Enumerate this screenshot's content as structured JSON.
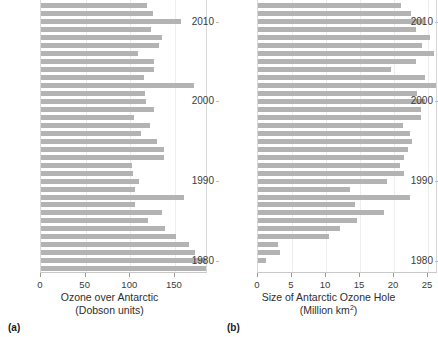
{
  "figure": {
    "background": "#ffffff",
    "bar_color": "#b3b3b3",
    "grid_color": "#ededed",
    "axis_color": "#c8c8c8"
  },
  "panels": [
    {
      "tag": "(a)",
      "tag_name": "panel-tag-a",
      "axis_title_line1": "Ozone over Antarctic",
      "axis_title_line2": "(Dobson units)",
      "xticks": [
        "0",
        "50",
        "100",
        "150"
      ],
      "ylabels": [
        "2010",
        "2000",
        "1990",
        "1980"
      ]
    },
    {
      "tag": "(b)",
      "tag_name": "panel-tag-b",
      "axis_title_line1": "Size of Antarctic Ozone Hole",
      "axis_title_line2": "(Million km",
      "axis_title_sup": "2",
      "axis_title_line2_end": ")",
      "xticks": [
        "0",
        "5",
        "10",
        "15",
        "20",
        "25"
      ],
      "ylabels": [
        "2010",
        "2000",
        "1990",
        "1980"
      ]
    }
  ],
  "chart_data": [
    {
      "type": "bar",
      "orientation": "horizontal",
      "title": "",
      "xlabel": "Ozone over Antarctic (Dobson units)",
      "ylabel": "",
      "xlim": [
        0,
        187
      ],
      "xticks": [
        0,
        50,
        100,
        150
      ],
      "ytick_labels": [
        2010,
        2000,
        1990,
        1980
      ],
      "grid": true,
      "legend": "none",
      "categories": [
        2013,
        2012,
        2011,
        2010,
        2009,
        2008,
        2007,
        2006,
        2005,
        2004,
        2003,
        2002,
        2001,
        2000,
        1999,
        1998,
        1997,
        1996,
        1995,
        1994,
        1993,
        1992,
        1991,
        1990,
        1989,
        1988,
        1987,
        1986,
        1985,
        1984,
        1983,
        1982,
        1981,
        1980,
        1979
      ],
      "values": [
        123,
        119,
        125,
        157,
        123,
        135,
        132,
        109,
        126,
        126,
        115,
        171,
        117,
        118,
        126,
        104,
        122,
        112,
        130,
        138,
        138,
        102,
        103,
        110,
        105,
        160,
        105,
        136,
        120,
        139,
        151,
        166,
        172,
        187,
        188
      ]
    },
    {
      "type": "bar",
      "orientation": "horizontal",
      "title": "",
      "xlabel": "Size of Antarctic Ozone Hole (Million km2)",
      "ylabel": "",
      "xlim": [
        0,
        26.5
      ],
      "xticks": [
        0,
        5,
        10,
        15,
        20,
        25
      ],
      "ytick_labels": [
        2010,
        2000,
        1990,
        1980
      ],
      "grid": true,
      "legend": "none",
      "categories": [
        2013,
        2012,
        2011,
        2010,
        2009,
        2008,
        2007,
        2006,
        2005,
        2004,
        2003,
        2002,
        2001,
        2000,
        1999,
        1998,
        1997,
        1996,
        1995,
        1994,
        1993,
        1992,
        1991,
        1990,
        1989,
        1988,
        1987,
        1986,
        1985,
        1984,
        1983,
        1982,
        1981,
        1980,
        1979
      ],
      "values": [
        23.5,
        21.0,
        22.5,
        24.4,
        23.2,
        25.3,
        24.1,
        25.9,
        23.2,
        19.5,
        24.6,
        26.5,
        23.4,
        24.5,
        23.9,
        23.9,
        21.3,
        22.4,
        22.7,
        22.0,
        21.5,
        20.9,
        21.4,
        19.0,
        13.6,
        22.3,
        14.3,
        18.6,
        14.5,
        12.0,
        10.5,
        3.0,
        3.2,
        1.2,
        0.0
      ]
    }
  ]
}
